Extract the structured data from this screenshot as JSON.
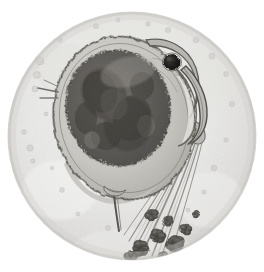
{
  "image": {
    "kind": "light-microscopy-photomicrograph",
    "subject": "Daphnia (water flea)",
    "alt_text": "Black and white photomicrograph of a Daphnia water flea seen through a circular microscope field of view",
    "width": 264,
    "height": 272,
    "color_mode": "grayscale",
    "has_text_labels": false,
    "has_scale_bar": false
  },
  "field_of_view": {
    "shape": "circle",
    "center_x": 132,
    "center_y": 136,
    "radius": 124,
    "outside_color": "#ffffff",
    "inside_color": "#e9e9e7",
    "rim_color": "#cfcfcc",
    "vignette_color": "#d6d6d3"
  },
  "palette": {
    "background_white": "#ffffff",
    "field_light_gray": "#ececeb",
    "field_mid_gray": "#dedede",
    "specimen_outline": "#4a4a48",
    "carapace_fill": "#c9c7c2",
    "carapace_shade": "#a9a7a1",
    "gut_dark": "#5e5c58",
    "gut_darker": "#474540",
    "eye_black": "#1b1a18",
    "antenna_gray": "#8d8b86",
    "debris_dark": "#45433f"
  },
  "anatomy": {
    "parts": [
      {
        "id": "carapace",
        "label": "Carapace (shell / body)",
        "center_x": 124,
        "center_y": 118,
        "radius_x": 70,
        "radius_y": 82,
        "rotation_deg": -12,
        "tone": "#c9c7c2"
      },
      {
        "id": "gut-brood-mass",
        "label": "Gut and brood chamber mass",
        "center_x": 118,
        "center_y": 108,
        "radius_x": 52,
        "radius_y": 58,
        "rotation_deg": -10,
        "tone": "#5e5c58"
      },
      {
        "id": "compound-eye",
        "label": "Compound eye",
        "center_x": 172,
        "center_y": 62,
        "radius": 8,
        "tone": "#1b1a18"
      },
      {
        "id": "head-rostrum",
        "label": "Head and rostrum (beak)",
        "tip_x": 206,
        "tip_y": 126,
        "tone": "#9b9994"
      },
      {
        "id": "antennules",
        "label": "Antennule (left lateral spur)",
        "x": 48,
        "y": 92,
        "tone": "#6f6d69"
      },
      {
        "id": "tail-spine",
        "label": "Tail spine (apical spine)",
        "x1": 116,
        "y1": 196,
        "x2": 120,
        "y2": 230,
        "tone": "#5c5a56"
      },
      {
        "id": "swimming-setae",
        "label": "Swimming antenna setae",
        "count": 7,
        "origin_x": 196,
        "origin_y": 128,
        "end_x": 138,
        "end_y": 256,
        "tone": "#8d8b86"
      },
      {
        "id": "debris-cluster",
        "label": "Dark debris / algal clumps",
        "count": 9,
        "region_x": 130,
        "region_y": 210,
        "region_w": 70,
        "region_h": 50,
        "tone": "#45433f"
      }
    ],
    "background_specks": [
      {
        "x": 40,
        "y": 61,
        "r": 4.0
      },
      {
        "x": 37,
        "y": 75,
        "r": 3.5
      },
      {
        "x": 35,
        "y": 89,
        "r": 3.0
      },
      {
        "x": 30,
        "y": 148,
        "r": 3.2
      },
      {
        "x": 24,
        "y": 132,
        "r": 2.4
      },
      {
        "x": 33,
        "y": 161,
        "r": 2.2
      },
      {
        "x": 60,
        "y": 40,
        "r": 2.4
      },
      {
        "x": 96,
        "y": 26,
        "r": 2.6
      },
      {
        "x": 118,
        "y": 20,
        "r": 2.0
      },
      {
        "x": 148,
        "y": 24,
        "r": 2.2
      },
      {
        "x": 168,
        "y": 30,
        "r": 2.6
      },
      {
        "x": 196,
        "y": 40,
        "r": 2.8
      },
      {
        "x": 212,
        "y": 56,
        "r": 3.0
      },
      {
        "x": 226,
        "y": 74,
        "r": 2.4
      },
      {
        "x": 232,
        "y": 104,
        "r": 2.6
      },
      {
        "x": 226,
        "y": 140,
        "r": 2.2
      },
      {
        "x": 214,
        "y": 168,
        "r": 2.8
      },
      {
        "x": 204,
        "y": 192,
        "r": 2.2
      },
      {
        "x": 62,
        "y": 190,
        "r": 2.4
      },
      {
        "x": 78,
        "y": 214,
        "r": 2.0
      },
      {
        "x": 108,
        "y": 228,
        "r": 2.6
      },
      {
        "x": 46,
        "y": 114,
        "r": 2.0
      },
      {
        "x": 52,
        "y": 168,
        "r": 1.8
      },
      {
        "x": 188,
        "y": 210,
        "r": 2.0
      }
    ]
  }
}
